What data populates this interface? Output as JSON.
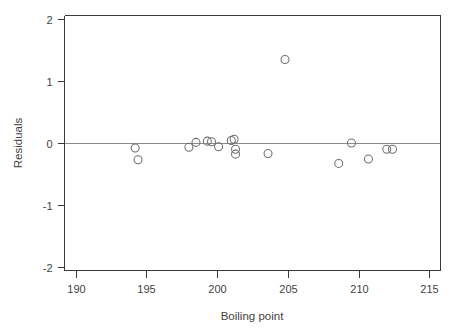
{
  "chart_data": {
    "type": "scatter",
    "title": "",
    "xlabel": "Boiling point",
    "ylabel": "Residuals",
    "xlim": [
      189.2,
      215.8
    ],
    "ylim": [
      -2.06,
      2.06
    ],
    "xticks": [
      190,
      195,
      200,
      205,
      210,
      215
    ],
    "yticks": [
      2,
      1,
      0,
      -1,
      -2
    ],
    "xtick_labels": [
      "190",
      "195",
      "200",
      "205",
      "210",
      "215"
    ],
    "ytick_labels": [
      "2",
      "1",
      "0",
      "-1",
      "-2"
    ],
    "grid": false,
    "legend": null,
    "reference_lines": [
      {
        "name": "zero-residual-line",
        "orientation": "horizontal",
        "y": 0
      }
    ],
    "marker": {
      "shape": "open-circle",
      "radius_px": 4,
      "edge_color": "#6e6e6e",
      "fill": "none"
    },
    "series": [
      {
        "name": "residuals",
        "points": [
          {
            "x": 194.2,
            "y": -0.08
          },
          {
            "x": 194.4,
            "y": -0.27
          },
          {
            "x": 198.0,
            "y": -0.07
          },
          {
            "x": 198.5,
            "y": 0.01
          },
          {
            "x": 199.3,
            "y": 0.03
          },
          {
            "x": 199.6,
            "y": 0.02
          },
          {
            "x": 200.1,
            "y": -0.06
          },
          {
            "x": 201.0,
            "y": 0.04
          },
          {
            "x": 201.2,
            "y": 0.06
          },
          {
            "x": 201.3,
            "y": -0.1
          },
          {
            "x": 201.3,
            "y": -0.18
          },
          {
            "x": 203.6,
            "y": -0.17
          },
          {
            "x": 204.8,
            "y": 1.35
          },
          {
            "x": 208.6,
            "y": -0.33
          },
          {
            "x": 209.5,
            "y": 0.0
          },
          {
            "x": 210.7,
            "y": -0.26
          },
          {
            "x": 212.0,
            "y": -0.1
          },
          {
            "x": 212.4,
            "y": -0.1
          }
        ]
      }
    ]
  }
}
